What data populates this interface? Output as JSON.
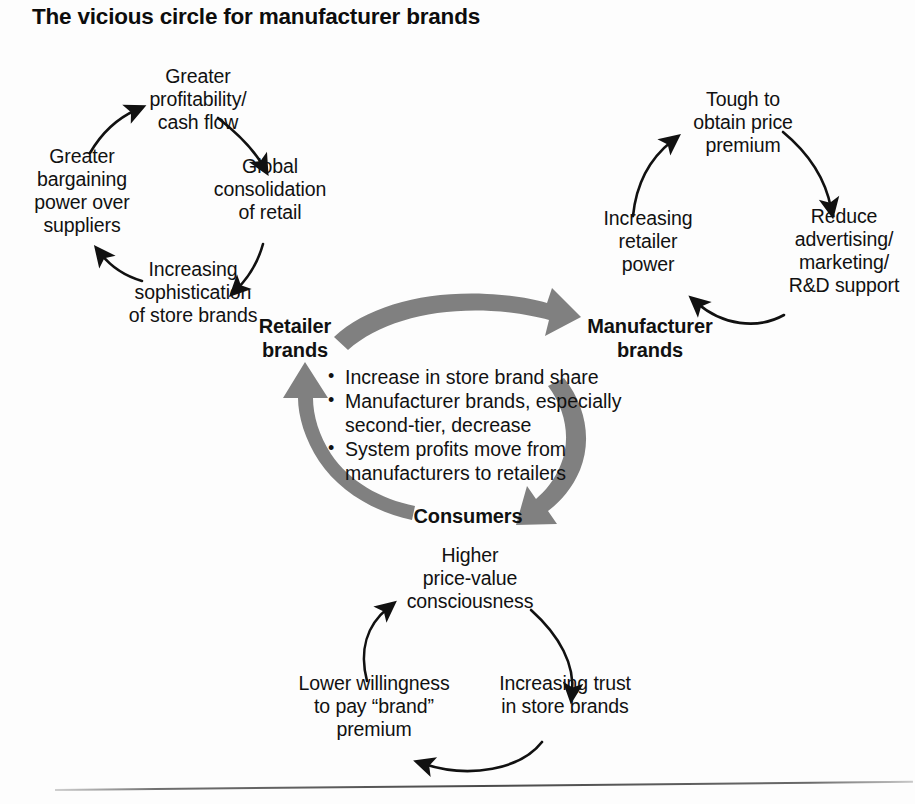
{
  "title": "The vicious circle for manufacturer brands",
  "colors": {
    "text": "#111111",
    "arrow_black": "#111111",
    "arrow_gray": "#808080",
    "background": "#fdfdfd",
    "rule": "#4a4a4a"
  },
  "center_cycle": {
    "nodes": [
      {
        "id": "retailer-brands",
        "label": "Retailer\nbrands"
      },
      {
        "id": "manufacturer-brands",
        "label": "Manufacturer\nbrands"
      },
      {
        "id": "consumers",
        "label": "Consumers"
      }
    ],
    "bullets": [
      "Increase in store brand share",
      "Manufacturer brands, especially second-tier, decrease",
      "System profits move from manufacturers to retailers"
    ],
    "flow": [
      {
        "from": "Retailer brands",
        "to": "Manufacturer brands"
      },
      {
        "from": "Manufacturer brands",
        "to": "Consumers"
      },
      {
        "from": "Consumers",
        "to": "Retailer brands"
      }
    ]
  },
  "retailer_loop": {
    "name": "retailer-brands-loop",
    "nodes": [
      {
        "id": "greater-profitability",
        "label": "Greater\nprofitability/\ncash flow"
      },
      {
        "id": "global-consolidation",
        "label": "Global\nconsolidation\nof retail"
      },
      {
        "id": "increasing-sophistication",
        "label": "Increasing\nsophistication\nof store brands"
      },
      {
        "id": "greater-bargaining-power",
        "label": "Greater\nbargaining\npower over\nsuppliers"
      }
    ]
  },
  "manufacturer_loop": {
    "name": "manufacturer-brands-loop",
    "nodes": [
      {
        "id": "tough-price-premium",
        "label": "Tough to\nobtain price\npremium"
      },
      {
        "id": "reduce-advertising",
        "label": "Reduce\nadvertising/\nmarketing/\nR&D support"
      },
      {
        "id": "increasing-retailer-power",
        "label": "Increasing\nretailer\npower"
      }
    ]
  },
  "consumer_loop": {
    "name": "consumers-loop",
    "nodes": [
      {
        "id": "higher-price-value",
        "label": "Higher\nprice-value\nconsciousness"
      },
      {
        "id": "increasing-trust",
        "label": "Increasing trust\nin store brands"
      },
      {
        "id": "lower-willingness",
        "label": "Lower willingness\nto pay “brand”\npremium"
      }
    ]
  }
}
